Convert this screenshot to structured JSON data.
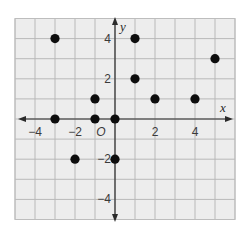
{
  "chart_data": {
    "type": "scatter",
    "title": "",
    "xlabel": "x",
    "ylabel": "y",
    "origin_label": "O",
    "xlim": [
      -5,
      6
    ],
    "ylim": [
      -5,
      5
    ],
    "grid": true,
    "x_tick_labels": [
      {
        "value": -4,
        "label": "−4"
      },
      {
        "value": -2,
        "label": "−2"
      },
      {
        "value": 2,
        "label": "2"
      },
      {
        "value": 4,
        "label": "4"
      }
    ],
    "y_tick_labels": [
      {
        "value": 4,
        "label": "4"
      },
      {
        "value": 2,
        "label": "2"
      },
      {
        "value": -2,
        "label": "−2"
      },
      {
        "value": -4,
        "label": "−4"
      }
    ],
    "points": [
      {
        "x": -3,
        "y": 4
      },
      {
        "x": 1,
        "y": 4
      },
      {
        "x": 5,
        "y": 3
      },
      {
        "x": 1,
        "y": 2
      },
      {
        "x": -1,
        "y": 1
      },
      {
        "x": 2,
        "y": 1
      },
      {
        "x": 4,
        "y": 1
      },
      {
        "x": -3,
        "y": 0
      },
      {
        "x": -1,
        "y": 0
      },
      {
        "x": 0,
        "y": 0
      },
      {
        "x": -2,
        "y": -2
      },
      {
        "x": 0,
        "y": -2
      }
    ],
    "colors": {
      "grid_background": "#ededed",
      "grid_line": "#b9b9b9",
      "axis": "#2a2a2a",
      "point": "#0d0d0d"
    }
  }
}
